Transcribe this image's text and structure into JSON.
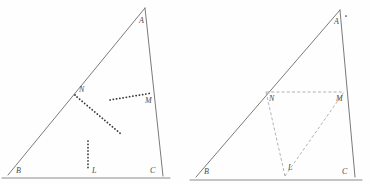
{
  "figure": {
    "background_color": "#fefefe",
    "edge_color": "#6b6b6b",
    "dotted_color": "#3a3a3a",
    "dashed_color": "#9a9a9a",
    "panels": [
      {
        "name": "left-panel",
        "triangle": {
          "vertices": {
            "A": {
              "x": 145,
              "y": 8,
              "label": "A",
              "label_x": 139,
              "label_y": 23
            },
            "B": {
              "x": 8,
              "y": 175,
              "label": "B",
              "label_x": 16,
              "label_y": 173
            },
            "C": {
              "x": 163,
              "y": 176,
              "label": "C",
              "label_x": 150,
              "label_y": 173
            }
          },
          "base_extend_left": {
            "x": 2,
            "y": 178
          },
          "base_extend_right": {
            "x": 170,
            "y": 178
          }
        },
        "points": [
          {
            "name": "N",
            "label": "N",
            "x": 75,
            "y": 95,
            "label_x": 79,
            "label_y": 92,
            "dot": true
          },
          {
            "name": "M",
            "label": "M",
            "x": 152,
            "y": 93,
            "label_x": 145,
            "label_y": 103,
            "dot": false
          },
          {
            "name": "L",
            "label": "L",
            "x": 88,
            "y": 170,
            "label_x": 92,
            "label_y": 173,
            "dot": false
          }
        ],
        "dotted_segments": [
          {
            "name": "segment-N-down",
            "x1": 77,
            "y1": 97,
            "x2": 121,
            "y2": 134
          },
          {
            "name": "segment-M-left",
            "x1": 110,
            "y1": 100,
            "x2": 152,
            "y2": 93
          },
          {
            "name": "segment-L-up",
            "x1": 88,
            "y1": 141,
            "x2": 88,
            "y2": 170
          }
        ],
        "dashed_segments": []
      },
      {
        "name": "right-panel",
        "triangle": {
          "vertices": {
            "A": {
              "x": 340,
              "y": 10,
              "label": "A",
              "label_x": 334,
              "label_y": 24
            },
            "B": {
              "x": 196,
              "y": 177,
              "label": "B",
              "label_x": 204,
              "label_y": 174
            },
            "C": {
              "x": 355,
              "y": 177,
              "label": "C",
              "label_x": 342,
              "label_y": 174
            }
          },
          "base_extend_left": {
            "x": 190,
            "y": 180
          },
          "base_extend_right": {
            "x": 362,
            "y": 180
          },
          "apex_marker": {
            "x": 346,
            "y": 16
          }
        },
        "points": [
          {
            "name": "N",
            "label": "N",
            "x": 266,
            "y": 92,
            "label_x": 269,
            "label_y": 101,
            "dot": false
          },
          {
            "name": "M",
            "label": "M",
            "x": 344,
            "y": 92,
            "label_x": 336,
            "label_y": 101,
            "dot": false
          },
          {
            "name": "L",
            "label": "L",
            "x": 285,
            "y": 176,
            "label_x": 288,
            "label_y": 170,
            "dot": false
          }
        ],
        "dotted_segments": [],
        "dashed_segments": [
          {
            "name": "segment-N-M",
            "x1": 266,
            "y1": 92,
            "x2": 344,
            "y2": 92
          },
          {
            "name": "segment-N-L",
            "x1": 266,
            "y1": 92,
            "x2": 285,
            "y2": 176
          },
          {
            "name": "segment-L-M",
            "x1": 285,
            "y1": 176,
            "x2": 344,
            "y2": 92
          }
        ]
      }
    ]
  }
}
